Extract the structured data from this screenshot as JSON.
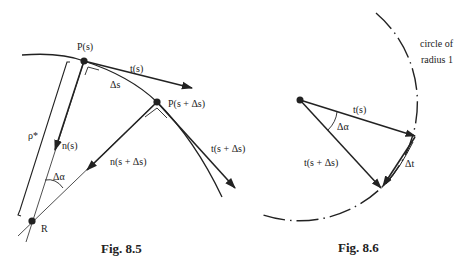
{
  "figures": [
    {
      "caption": "Fig. 8.5",
      "labels": {
        "p_s": "P(s)",
        "p_s_ds": "P(s + Δs)",
        "t_s": "t(s)",
        "t_s_ds": "t(s + Δs)",
        "delta_s": "Δs",
        "n_s": "n(s)",
        "n_s_ds": "n(s + Δs)",
        "delta_alpha": "Δα",
        "rho_star": "ρ*",
        "r": "R"
      }
    },
    {
      "caption": "Fig. 8.6",
      "labels": {
        "circle_line1": "circle of",
        "circle_line2": "radius 1",
        "t_s": "t(s)",
        "t_s_ds": "t(s + Δs)",
        "delta_alpha": "Δα",
        "delta_t": "Δt"
      }
    }
  ],
  "colors": {
    "ink": "#222222",
    "background": "#ffffff"
  }
}
